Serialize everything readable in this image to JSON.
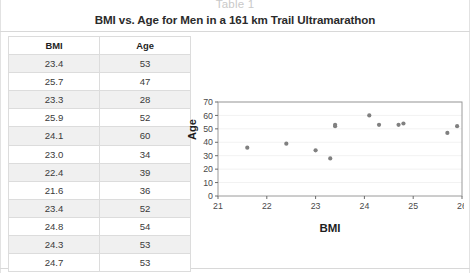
{
  "caption": "Table 1",
  "title": "BMI vs. Age for Men in a 161 km Trail Ultramarathon",
  "table": {
    "headers": [
      "BMI",
      "Age"
    ],
    "rows": [
      [
        "23.4",
        "53"
      ],
      [
        "25.7",
        "47"
      ],
      [
        "23.3",
        "28"
      ],
      [
        "25.9",
        "52"
      ],
      [
        "24.1",
        "60"
      ],
      [
        "23.0",
        "34"
      ],
      [
        "22.4",
        "39"
      ],
      [
        "21.6",
        "36"
      ],
      [
        "23.4",
        "52"
      ],
      [
        "24.8",
        "54"
      ],
      [
        "24.3",
        "53"
      ],
      [
        "24.7",
        "53"
      ]
    ]
  },
  "chart_data": {
    "type": "scatter",
    "title": "",
    "xlabel": "BMI",
    "ylabel": "Age",
    "xlim": [
      21,
      26
    ],
    "ylim": [
      0,
      70
    ],
    "xticks": [
      21,
      22,
      23,
      24,
      25,
      26
    ],
    "yticks": [
      0,
      10,
      20,
      30,
      40,
      50,
      60,
      70
    ],
    "grid": true,
    "legend": null,
    "marker_color": "#808080",
    "points": [
      {
        "x": 23.4,
        "y": 53
      },
      {
        "x": 25.7,
        "y": 47
      },
      {
        "x": 23.3,
        "y": 28
      },
      {
        "x": 25.9,
        "y": 52
      },
      {
        "x": 24.1,
        "y": 60
      },
      {
        "x": 23.0,
        "y": 34
      },
      {
        "x": 22.4,
        "y": 39
      },
      {
        "x": 21.6,
        "y": 36
      },
      {
        "x": 23.4,
        "y": 52
      },
      {
        "x": 24.8,
        "y": 54
      },
      {
        "x": 24.3,
        "y": 53
      },
      {
        "x": 24.7,
        "y": 53
      }
    ]
  },
  "colors": {
    "border": "#dcdcdc",
    "stripe": "#f0f0f0",
    "text": "#3a3a3a",
    "caption": "#c9c9c9"
  }
}
